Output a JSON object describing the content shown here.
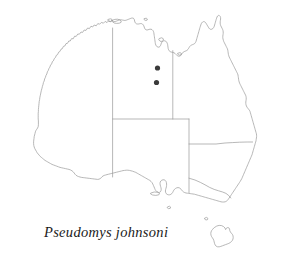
{
  "figure": {
    "type": "distribution-map",
    "region": "Australia",
    "background_color": "#ffffff",
    "outline_color": "#9a9a9a",
    "dot_color": "#3a3a3a"
  },
  "caption": {
    "text": "Pseudomys johnsoni",
    "style": "italic"
  },
  "chart_data": {
    "type": "scatter",
    "title": "Pseudomys johnsoni",
    "xlabel": "",
    "ylabel": "",
    "map_region": "Australia",
    "grid": false,
    "legend": "none",
    "series": [
      {
        "name": "occurrence-records",
        "marker": "filled-circle",
        "color": "#3a3a3a",
        "points": [
          {
            "label": "record-1",
            "x": 157.5,
            "y": 68.0
          },
          {
            "label": "record-2",
            "x": 156.5,
            "y": 82.5
          }
        ]
      }
    ],
    "annotations": [
      {
        "text": "Pseudomys johnsoni",
        "x": 46,
        "y": 233
      }
    ]
  },
  "map_features": {
    "mainland_label": "Australian mainland",
    "island_labels": [
      "Melville Island",
      "Groote Eylandt",
      "Kangaroo Island",
      "Tasmania"
    ],
    "state_border_label": "state and territory boundaries"
  }
}
